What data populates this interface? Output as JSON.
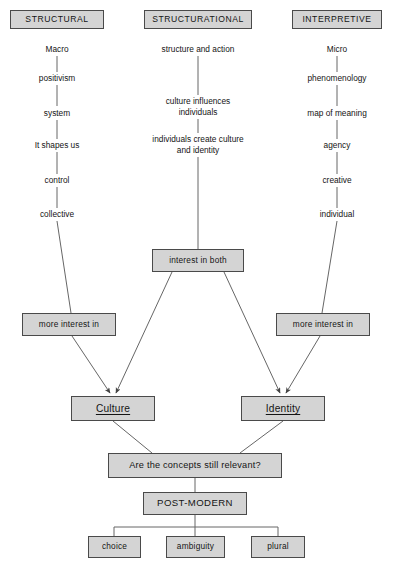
{
  "diagram": {
    "colors": {
      "node_fill": "#d4d4d4",
      "node_border": "#4a4a4a",
      "line": "#555555",
      "text": "#141414",
      "background": "#ffffff"
    },
    "headers": [
      {
        "id": "structural",
        "label": "STRUCTURAL"
      },
      {
        "id": "structurational",
        "label": "STRUCTURATIONAL"
      },
      {
        "id": "interpretive",
        "label": "INTERPRETIVE"
      }
    ],
    "columns": {
      "structural": [
        {
          "label": "Macro"
        },
        {
          "label": "positivism"
        },
        {
          "label": "system"
        },
        {
          "label": "It shapes us"
        },
        {
          "label": "control"
        },
        {
          "label": "collective"
        }
      ],
      "structurational": [
        {
          "label": "structure and action"
        },
        {
          "label": "culture influences\nindividuals"
        },
        {
          "label": "individuals create culture\nand identity"
        }
      ],
      "interpretive": [
        {
          "label": "Micro"
        },
        {
          "label": "phenomenology"
        },
        {
          "label": "map of meaning"
        },
        {
          "label": "agency"
        },
        {
          "label": "creative"
        },
        {
          "label": "individual"
        }
      ]
    },
    "nodes": {
      "interest_in_both": "interest in both",
      "more_interest_in_left": "more interest in",
      "more_interest_in_right": "more interest in",
      "culture": "Culture",
      "identity": "Identity",
      "question": "Are the concepts still relevant?",
      "post_modern": "POST-MODERN"
    },
    "outcomes": [
      {
        "label": "choice"
      },
      {
        "label": "ambiguity"
      },
      {
        "label": "plural"
      }
    ]
  }
}
